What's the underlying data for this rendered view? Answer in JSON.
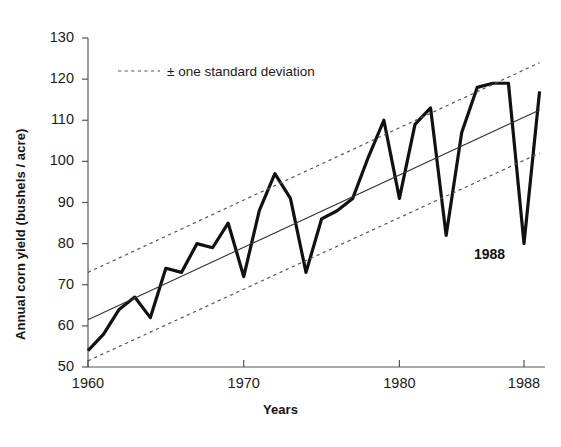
{
  "chart_data": {
    "type": "line",
    "title": "",
    "xlabel": "Years",
    "ylabel": "Annual corn yield (bushels / acre)",
    "xlim": [
      1960,
      1989
    ],
    "ylim": [
      50,
      130
    ],
    "ytick_step": 10,
    "grid": false,
    "legend_position": "top-left-inside",
    "legend": [
      {
        "label": "± one standard deviation",
        "style": "dotted",
        "color": "#555555"
      }
    ],
    "yticks": [
      50,
      60,
      70,
      80,
      90,
      100,
      110,
      120,
      130
    ],
    "ytick_labels": [
      "50",
      "60",
      "70",
      "80",
      "90",
      "100",
      "110",
      "120",
      "130"
    ],
    "xticks": [
      1960,
      1970,
      1980,
      1988
    ],
    "xtick_labels": [
      "1960",
      "1970",
      "1980",
      "1988"
    ],
    "annotations": [
      {
        "text": "1988",
        "x": 1988,
        "y": 74,
        "bold": true
      }
    ],
    "series": [
      {
        "name": "Annual corn yield",
        "style": "solid-thick",
        "color": "#111111",
        "x": [
          1960,
          1961,
          1962,
          1963,
          1964,
          1965,
          1966,
          1967,
          1968,
          1969,
          1970,
          1971,
          1972,
          1973,
          1974,
          1975,
          1976,
          1977,
          1978,
          1979,
          1980,
          1981,
          1982,
          1983,
          1984,
          1985,
          1986,
          1987,
          1988,
          1989
        ],
        "values": [
          54,
          58,
          64,
          67,
          62,
          74,
          73,
          80,
          79,
          85,
          72,
          88,
          97,
          91,
          73,
          86,
          88,
          91,
          101,
          110,
          91,
          109,
          113,
          82,
          107,
          118,
          119,
          119,
          80,
          117
        ]
      },
      {
        "name": "Linear trend",
        "style": "solid-thin",
        "color": "#333333",
        "x": [
          1960,
          1989
        ],
        "values": [
          61.5,
          112.5
        ]
      },
      {
        "name": "Upper one standard deviation",
        "style": "dotted",
        "color": "#555555",
        "x": [
          1960,
          1989
        ],
        "values": [
          73,
          124
        ]
      },
      {
        "name": "Lower one standard deviation",
        "style": "dotted",
        "color": "#555555",
        "x": [
          1960,
          1989
        ],
        "values": [
          51.5,
          102
        ]
      }
    ]
  },
  "axes": {
    "ylabel": "Annual corn yield (bushels / acre)",
    "xlabel": "Years"
  },
  "legend": {
    "std_label": "± one standard deviation"
  },
  "annotations": {
    "year_1988": "1988"
  },
  "colors": {
    "data_line": "#111111",
    "trend_line": "#333333",
    "band_line": "#555555",
    "axis": "#555555",
    "text": "#1a1a1a",
    "background": "#ffffff"
  }
}
